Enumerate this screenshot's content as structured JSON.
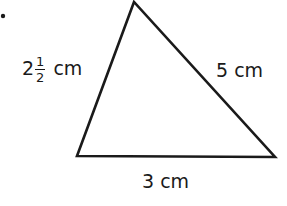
{
  "figure": {
    "type": "triangle",
    "stroke_color": "#1a1a1a",
    "vertices": {
      "top": [
        134,
        2
      ],
      "bottom_left": [
        77,
        156
      ],
      "bottom_right": [
        275,
        157
      ]
    },
    "sides": {
      "left": {
        "whole": "2",
        "numerator": "1",
        "denominator": "2",
        "unit": "cm"
      },
      "right": {
        "text": "5 cm"
      },
      "bottom": {
        "text": "3 cm"
      }
    }
  }
}
